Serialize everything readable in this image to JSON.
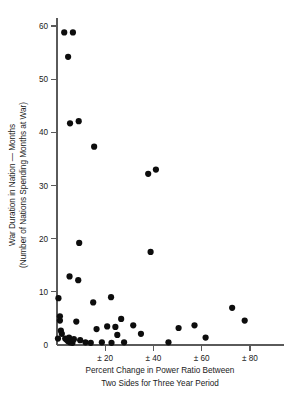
{
  "chart_data": {
    "type": "scatter",
    "title": "",
    "xlabel": "Percent Change in Power Ratio Between Two Sides for Three Year Period",
    "xlabel_line1": "Percent Change in Power Ratio Between",
    "xlabel_line2": "Two Sides for Three Year Period",
    "ylabel": "War Duration in Nation — Months (Number of Nations Spending Months at War)",
    "ylabel_line1": "War Duration in Nation — Months",
    "ylabel_line2": "(Number of Nations Spending Months at War)",
    "xlim": [
      0,
      86
    ],
    "ylim": [
      0,
      62
    ],
    "grid": false,
    "legend": false,
    "x_ticks": [
      {
        "value": 0,
        "label": "0"
      },
      {
        "value": 20,
        "label": "± 20"
      },
      {
        "value": 40,
        "label": "± 40"
      },
      {
        "value": 60,
        "label": "± 60"
      },
      {
        "value": 80,
        "label": "± 80"
      }
    ],
    "y_ticks": [
      {
        "value": 0,
        "label": "0"
      },
      {
        "value": 10,
        "label": "10"
      },
      {
        "value": 20,
        "label": "20"
      },
      {
        "value": 30,
        "label": "30"
      },
      {
        "value": 40,
        "label": "40"
      },
      {
        "value": 50,
        "label": "50"
      },
      {
        "value": 60,
        "label": "60"
      }
    ],
    "marker": {
      "shape": "circle",
      "color": "#0d0d0d",
      "size": 3.1
    },
    "point_count": 48,
    "points": [
      {
        "x": 3.0,
        "y": 58.8
      },
      {
        "x": 6.6,
        "y": 58.8
      },
      {
        "x": 4.6,
        "y": 54.2
      },
      {
        "x": 5.4,
        "y": 41.7
      },
      {
        "x": 9.0,
        "y": 42.1
      },
      {
        "x": 15.4,
        "y": 37.3
      },
      {
        "x": 37.8,
        "y": 32.2
      },
      {
        "x": 41.0,
        "y": 33.0
      },
      {
        "x": 9.2,
        "y": 19.2
      },
      {
        "x": 38.8,
        "y": 17.5
      },
      {
        "x": 5.2,
        "y": 12.9
      },
      {
        "x": 8.8,
        "y": 12.2
      },
      {
        "x": 0.6,
        "y": 8.8
      },
      {
        "x": 22.4,
        "y": 9.0
      },
      {
        "x": 15.0,
        "y": 8.0
      },
      {
        "x": 72.6,
        "y": 7.0
      },
      {
        "x": 1.2,
        "y": 5.4
      },
      {
        "x": 1.2,
        "y": 4.6
      },
      {
        "x": 8.0,
        "y": 4.4
      },
      {
        "x": 26.6,
        "y": 4.9
      },
      {
        "x": 77.8,
        "y": 4.6
      },
      {
        "x": 1.6,
        "y": 2.7
      },
      {
        "x": 2.0,
        "y": 2.1
      },
      {
        "x": 16.4,
        "y": 3.0
      },
      {
        "x": 20.8,
        "y": 3.5
      },
      {
        "x": 24.2,
        "y": 3.4
      },
      {
        "x": 31.6,
        "y": 3.7
      },
      {
        "x": 50.4,
        "y": 3.2
      },
      {
        "x": 57.0,
        "y": 3.7
      },
      {
        "x": 25.0,
        "y": 1.9
      },
      {
        "x": 34.8,
        "y": 2.1
      },
      {
        "x": 61.6,
        "y": 1.4
      },
      {
        "x": 0.4,
        "y": 1.2
      },
      {
        "x": 3.4,
        "y": 1.2
      },
      {
        "x": 4.0,
        "y": 1.0
      },
      {
        "x": 4.6,
        "y": 0.7
      },
      {
        "x": 5.0,
        "y": 1.4
      },
      {
        "x": 5.4,
        "y": 0.5
      },
      {
        "x": 6.0,
        "y": 0.9
      },
      {
        "x": 6.4,
        "y": 0.4
      },
      {
        "x": 7.0,
        "y": 1.1
      },
      {
        "x": 9.6,
        "y": 0.9
      },
      {
        "x": 11.8,
        "y": 0.5
      },
      {
        "x": 14.0,
        "y": 0.4
      },
      {
        "x": 18.6,
        "y": 0.5
      },
      {
        "x": 22.6,
        "y": 0.4
      },
      {
        "x": 27.8,
        "y": 0.5
      },
      {
        "x": 46.2,
        "y": 0.5
      }
    ]
  }
}
